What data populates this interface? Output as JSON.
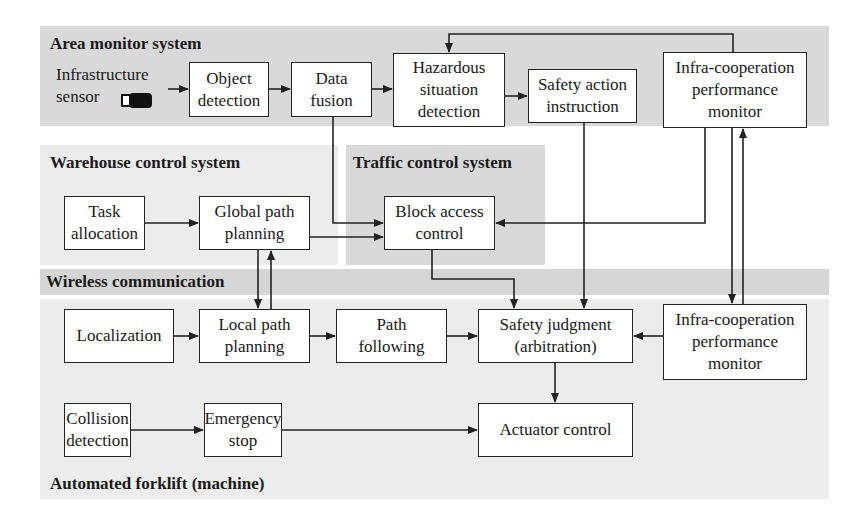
{
  "regions": {
    "area_monitor": "Area monitor system",
    "warehouse_control": "Warehouse control system",
    "traffic_control": "Traffic control system",
    "wireless": "Wireless communication",
    "forklift": "Automated forklift (machine)"
  },
  "sensor": {
    "label": "Infrastructure\nsensor",
    "icon": "camera-icon"
  },
  "boxes": {
    "object_detection": "Object\ndetection",
    "data_fusion": "Data\nfusion",
    "hazardous_detection": "Hazardous\nsituation\ndetection",
    "safety_action": "Safety action\ninstruction",
    "infra_monitor_top": "Infra-cooperation\nperformance\nmonitor",
    "task_allocation": "Task\nallocation",
    "global_path": "Global path\nplanning",
    "block_access": "Block access\ncontrol",
    "localization": "Localization",
    "local_path": "Local path\nplanning",
    "path_following": "Path\nfollowing",
    "safety_judgment": "Safety judgment\n(arbitration)",
    "infra_monitor_bottom": "Infra-cooperation\nperformance\nmonitor",
    "collision_detection": "Collision\ndetection",
    "emergency_stop": "Emergency\nstop",
    "actuator_control": "Actuator control"
  },
  "colors": {
    "region_dark": "#d9d9d9",
    "region_light": "#ececec",
    "line": "#222222"
  }
}
